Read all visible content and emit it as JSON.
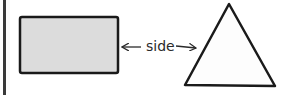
{
  "diagram": {
    "label": "side",
    "shapes": [
      {
        "type": "rectangle",
        "fill": "#dcdcdc",
        "stroke": "#1a1a1a"
      },
      {
        "type": "triangle",
        "fill": "#fdfdfd",
        "stroke": "#1a1a1a"
      }
    ],
    "arrow": {
      "direction": "both",
      "color": "#2a2a2a"
    },
    "colors": {
      "rect_fill": "#dcdcdc",
      "triangle_fill": "#fdfdfd",
      "stroke": "#1a1a1a",
      "left_bar": "#3a3a3a"
    }
  }
}
